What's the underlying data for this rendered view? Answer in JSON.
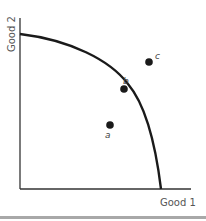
{
  "diagram": {
    "type": "production-possibilities-frontier",
    "x_axis_label": "Good 1",
    "y_axis_label": "Good 2",
    "points": [
      {
        "id": "a",
        "label": "a",
        "position": "inside frontier"
      },
      {
        "id": "b",
        "label": "b",
        "position": "on frontier"
      },
      {
        "id": "c",
        "label": "c",
        "position": "outside frontier"
      }
    ]
  },
  "colors": {
    "line": "#1a1a1a",
    "axis": "#333333",
    "text": "#555555",
    "band": "#a8a8a8"
  }
}
